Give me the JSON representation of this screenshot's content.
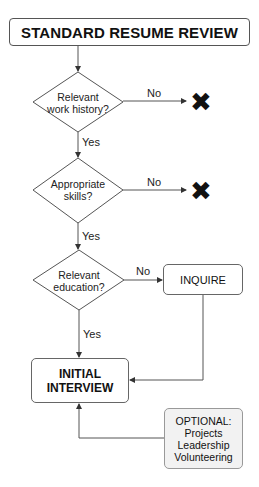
{
  "diagram": {
    "title": "STANDARD RESUME REVIEW",
    "decisions": [
      {
        "line1": "Relevant",
        "line2": "work history?",
        "no_label": "No",
        "yes_label": "Yes",
        "no_target": "reject"
      },
      {
        "line1": "Appropriate",
        "line2": "skills?",
        "no_label": "No",
        "yes_label": "Yes",
        "no_target": "reject"
      },
      {
        "line1": "Relevant",
        "line2": "education?",
        "no_label": "No",
        "yes_label": "Yes",
        "no_target": "inquire"
      }
    ],
    "reject_symbol": "✖",
    "inquire_label": "INQUIRE",
    "interview": {
      "line1": "INITIAL",
      "line2": "INTERVIEW"
    },
    "optional": {
      "heading": "OPTIONAL:",
      "items": [
        "Projects",
        "Leadership",
        "Volunteering"
      ]
    },
    "colors": {
      "stroke": "#555555",
      "text": "#111111",
      "optional_fill": "#f2f2f2"
    }
  }
}
